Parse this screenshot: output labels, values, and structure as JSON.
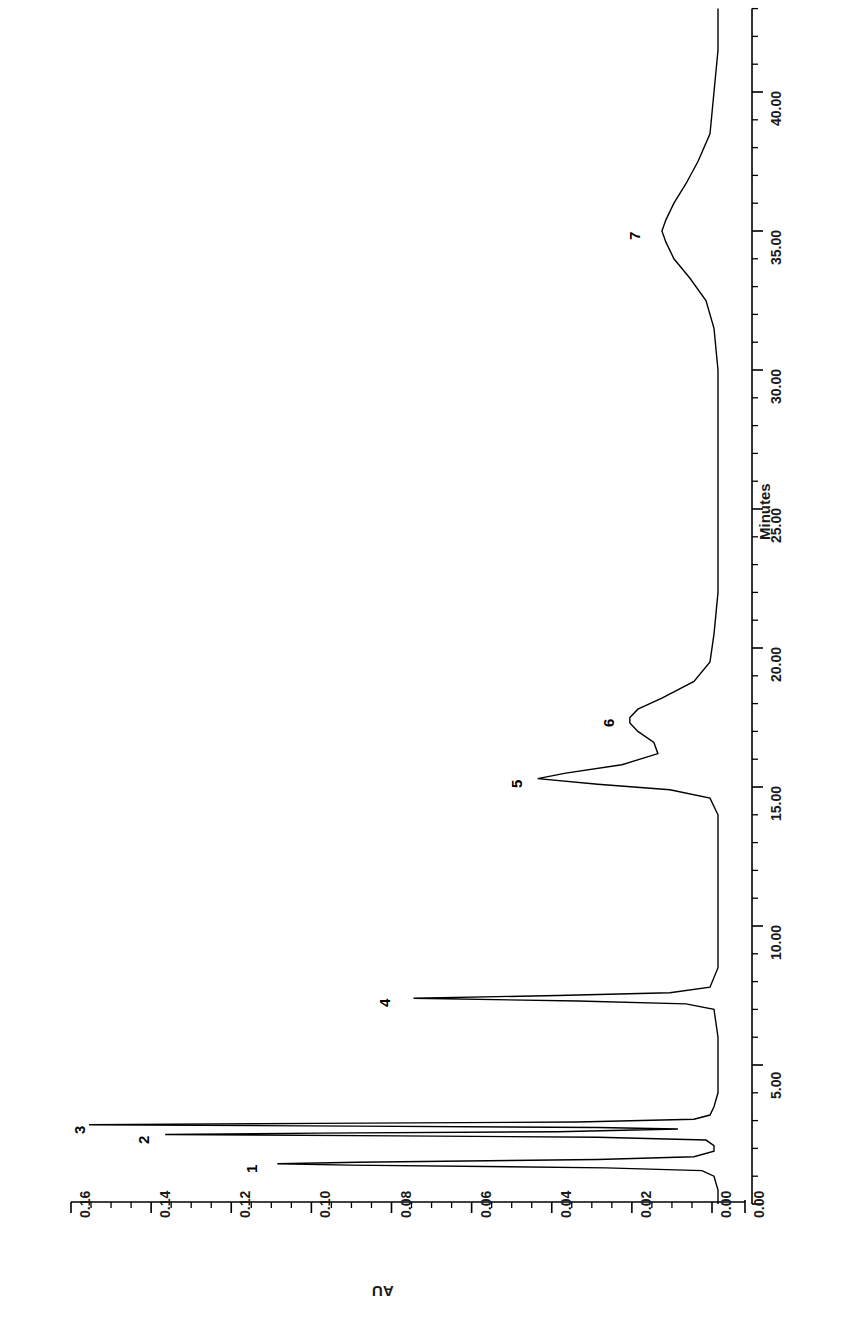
{
  "figure": {
    "kind": "chromatogram",
    "orientation": "rotated-90",
    "axis_titles": {
      "signal": "AU",
      "time": "Minutes"
    }
  },
  "axes": {
    "signal_axis": {
      "label": "AU",
      "tick_labels": [
        "0.16",
        "0.14",
        "0.12",
        "0.10",
        "0.08",
        "0.06",
        "0.04",
        "0.02",
        "0.00"
      ],
      "tick_values": [
        0.16,
        0.14,
        0.12,
        0.1,
        0.08,
        0.06,
        0.04,
        0.02,
        0.0
      ],
      "minor_per_major": 4,
      "range": [
        0.0,
        0.165
      ]
    },
    "time_axis": {
      "label": "Minutes",
      "tick_labels": [
        "0.00",
        "5.00",
        "10.00",
        "15.00",
        "20.00",
        "25.00",
        "30.00",
        "35.00",
        "40.00"
      ],
      "tick_values": [
        0,
        5,
        10,
        15,
        20,
        25,
        30,
        35,
        40
      ],
      "minor_per_major": 5,
      "range": [
        0.0,
        43.0
      ]
    }
  },
  "peaks": [
    {
      "label": "1",
      "retention_time": 1.45,
      "height_au": 0.11
    },
    {
      "label": "2",
      "retention_time": 2.5,
      "height_au": 0.138
    },
    {
      "label": "3",
      "retention_time": 2.85,
      "height_au": 0.157
    },
    {
      "label": "4",
      "retention_time": 7.4,
      "height_au": 0.076
    },
    {
      "label": "5",
      "retention_time": 15.3,
      "height_au": 0.045
    },
    {
      "label": "6",
      "retention_time": 17.5,
      "height_au": 0.022
    },
    {
      "label": "7",
      "retention_time": 35.0,
      "height_au": 0.014
    }
  ],
  "chart_data": {
    "type": "line",
    "title": "",
    "subtitle": "",
    "xlabel": "Minutes",
    "ylabel": "AU",
    "xlim": [
      0.0,
      43.0
    ],
    "ylim": [
      0.0,
      0.165
    ],
    "grid": false,
    "legend": "none",
    "orientation": "rotated 90 degrees (time axis vertical, signal axis horizontal)",
    "xticks": [
      0,
      5,
      10,
      15,
      20,
      25,
      30,
      35,
      40
    ],
    "xtick_labels": [
      "0.00",
      "5.00",
      "10.00",
      "15.00",
      "20.00",
      "25.00",
      "30.00",
      "35.00",
      "40.00"
    ],
    "yticks": [
      0.0,
      0.02,
      0.04,
      0.06,
      0.08,
      0.1,
      0.12,
      0.14,
      0.16
    ],
    "ytick_labels": [
      "0.00",
      "0.02",
      "0.04",
      "0.06",
      "0.08",
      "0.10",
      "0.12",
      "0.14",
      "0.16"
    ],
    "annotations": [
      {
        "text": "1",
        "x": 1.45,
        "y": 0.11
      },
      {
        "text": "2",
        "x": 2.5,
        "y": 0.138
      },
      {
        "text": "3",
        "x": 2.85,
        "y": 0.157
      },
      {
        "text": "4",
        "x": 7.4,
        "y": 0.076
      },
      {
        "text": "5",
        "x": 15.3,
        "y": 0.045
      },
      {
        "text": "6",
        "x": 17.5,
        "y": 0.022
      },
      {
        "text": "7",
        "x": 35.0,
        "y": 0.014
      }
    ],
    "series": [
      {
        "name": "UV absorbance trace",
        "color": "#000000",
        "peaks": [
          {
            "label": "1",
            "rt": 1.45,
            "height": 0.11,
            "width": 0.18
          },
          {
            "label": "2",
            "rt": 2.5,
            "height": 0.138,
            "width": 0.16
          },
          {
            "label": "3",
            "rt": 2.85,
            "height": 0.157,
            "width": 0.17
          },
          {
            "label": "4",
            "rt": 7.4,
            "height": 0.076,
            "width": 0.2
          },
          {
            "label": "5",
            "rt": 15.3,
            "height": 0.045,
            "width": 0.42
          },
          {
            "label": "6",
            "rt": 17.5,
            "height": 0.022,
            "width": 0.85
          },
          {
            "label": "7",
            "rt": 35.0,
            "height": 0.014,
            "width": 2.1
          }
        ],
        "baseline": 0.0,
        "x": [
          0.0,
          0.5,
          1.0,
          1.2,
          1.3,
          1.4,
          1.45,
          1.5,
          1.6,
          1.7,
          1.9,
          2.1,
          2.3,
          2.4,
          2.45,
          2.5,
          2.55,
          2.6,
          2.7,
          2.75,
          2.8,
          2.85,
          2.9,
          2.95,
          3.05,
          3.2,
          3.5,
          4.0,
          5.0,
          6.0,
          7.0,
          7.2,
          7.3,
          7.4,
          7.5,
          7.6,
          7.8,
          8.5,
          10.0,
          12.0,
          14.0,
          14.6,
          14.9,
          15.1,
          15.3,
          15.5,
          15.8,
          16.2,
          16.6,
          17.0,
          17.3,
          17.5,
          17.8,
          18.2,
          18.8,
          19.5,
          20.5,
          22.0,
          25.0,
          28.0,
          30.0,
          31.5,
          32.5,
          33.3,
          34.0,
          34.6,
          35.0,
          35.4,
          36.0,
          36.7,
          37.5,
          38.5,
          40.0,
          41.5,
          43.0
        ],
        "y": [
          0.0,
          0.0,
          0.001,
          0.004,
          0.028,
          0.092,
          0.11,
          0.09,
          0.03,
          0.006,
          0.001,
          0.001,
          0.003,
          0.03,
          0.08,
          0.138,
          0.1,
          0.04,
          0.01,
          0.03,
          0.09,
          0.157,
          0.1,
          0.035,
          0.006,
          0.002,
          0.001,
          0.0,
          0.0,
          0.0,
          0.001,
          0.008,
          0.035,
          0.076,
          0.04,
          0.012,
          0.002,
          0.0,
          0.0,
          0.0,
          0.0,
          0.002,
          0.012,
          0.03,
          0.045,
          0.038,
          0.024,
          0.015,
          0.016,
          0.02,
          0.022,
          0.022,
          0.02,
          0.014,
          0.006,
          0.002,
          0.001,
          0.0,
          0.0,
          0.0,
          0.0,
          0.001,
          0.003,
          0.007,
          0.011,
          0.013,
          0.014,
          0.013,
          0.011,
          0.008,
          0.005,
          0.002,
          0.001,
          0.0,
          0.0
        ]
      }
    ]
  },
  "colors": {
    "trace": "#000000",
    "axis": "#000000",
    "background": "#ffffff"
  }
}
